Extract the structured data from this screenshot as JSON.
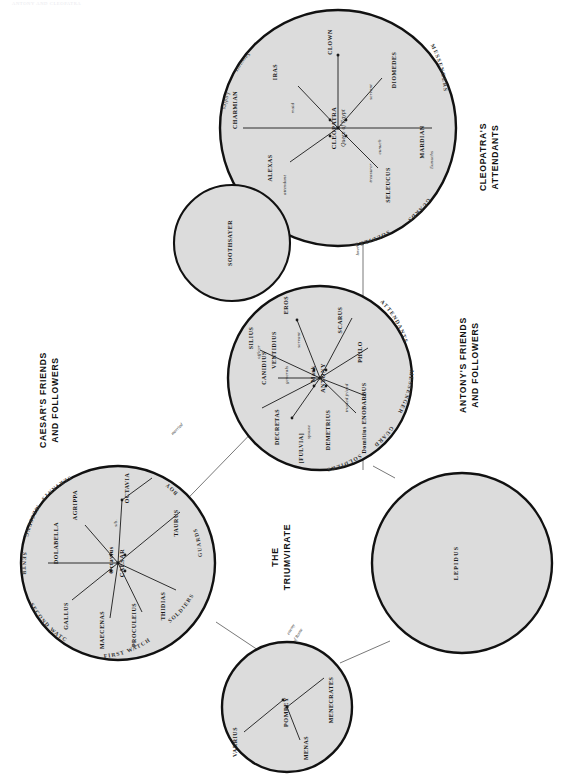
{
  "page": {
    "header_text": "ANTONY AND CLEOPATRA",
    "fill_color": "#dcdcdc",
    "stroke_color": "#111111",
    "background": "#ffffff"
  },
  "group_labels": [
    {
      "id": "cleopatra",
      "lines": [
        "CLEOPATRA'S",
        "ATTENDANTS"
      ]
    },
    {
      "id": "antony",
      "lines": [
        "ANTONY'S FRIENDS",
        "AND FOLLOWERS"
      ]
    },
    {
      "id": "caesar",
      "lines": [
        "CAESAR'S FRIENDS",
        "AND FOLLOWERS"
      ]
    },
    {
      "id": "triumvirate",
      "lines": [
        "THE",
        "TRIUMVIRATE"
      ]
    }
  ],
  "circles": {
    "cleopatra": {
      "center_name": "CLEOPATRA",
      "center_title": "Queen of Egypt",
      "members": [
        {
          "name": "CLOWN",
          "relation": ""
        },
        {
          "name": "IRAS",
          "relation": "maid"
        },
        {
          "name": "CHARMIAN",
          "relation": ""
        },
        {
          "name": "ALEXAS",
          "relation": "attendant"
        },
        {
          "name": "SELEUCUS",
          "relation": "treasurer"
        },
        {
          "name": "MARDIAN",
          "relation": "eunuch"
        },
        {
          "name": "DIOMEDES",
          "relation": "servant"
        }
      ],
      "rim_labels": [
        "MESSENGERS",
        "GUARDS",
        "SOLDIERS"
      ],
      "rim_labels_italic": [
        "Servants",
        "Ladies"
      ],
      "sub_labels": [
        "Eunuchs"
      ]
    },
    "soothsayer": {
      "center_name": "SOOTHSAYER",
      "members": [],
      "rim_labels": []
    },
    "antony": {
      "center_name": "Mark ANTONY",
      "center_name_line1": "Mark",
      "center_name_line2": "ANTONY",
      "members": [
        {
          "name": "EROS",
          "relation": "servant"
        },
        {
          "name": "SILIUS",
          "relation": "officer"
        },
        {
          "name": "CANIDIUS",
          "relation": "generals"
        },
        {
          "name": "VENTIDIUS",
          "relation": "generals"
        },
        {
          "name": "DECRETAS",
          "relation": ""
        },
        {
          "name": "[FULVIA]",
          "relation": "spouse"
        },
        {
          "name": "DEMETRIUS",
          "relation": ""
        },
        {
          "name": "Domitius ENOBARBUS",
          "relation": "trusted friend"
        },
        {
          "name": "PHILO",
          "relation": ""
        },
        {
          "name": "SCARUS",
          "relation": ""
        }
      ],
      "rim_labels": [
        "ATTENDANTS",
        "MESSENGERS",
        "GUARDS",
        "SOLDIERS"
      ]
    },
    "caesar": {
      "center_name": "Octavius CAESAR",
      "center_name_line1": "Octavius",
      "center_name_line2": "CAESAR",
      "members": [
        {
          "name": "OCTAVIA",
          "relation": "sib."
        },
        {
          "name": "AGRIPPA",
          "relation": ""
        },
        {
          "name": "DOLABELLA",
          "relation": ""
        },
        {
          "name": "GALLUS",
          "relation": ""
        },
        {
          "name": "MAECENAS",
          "relation": ""
        },
        {
          "name": "PROCULEIUS",
          "relation": ""
        },
        {
          "name": "THIDIAS",
          "relation": ""
        },
        {
          "name": "TAURUS",
          "relation": ""
        }
      ],
      "rim_labels": [
        "SERVANTS",
        "MESSENGERS",
        "SENTRY",
        "SECOND WATCH",
        "FIRST WATCH",
        "SOLDIERS",
        "GUARDS",
        "BOY"
      ]
    },
    "lepidus": {
      "center_name": "LEPIDUS",
      "members": [],
      "rim_labels": []
    },
    "pompey": {
      "center_name": "POMPEY",
      "members": [
        {
          "name": "MENECRATES",
          "relation": ""
        },
        {
          "name": "MENAS",
          "relation": ""
        },
        {
          "name": "VARRIUS",
          "relation": ""
        }
      ],
      "rim_labels": []
    }
  },
  "connections": [
    {
      "from": "cleopatra",
      "to": "antony",
      "label": "lovers"
    },
    {
      "from": "caesar",
      "to": "antony",
      "label": "married"
    },
    {
      "from": "pompey",
      "to": "caesar",
      "label": "enemy of Rome"
    },
    {
      "from": "antony",
      "to": "lepidus",
      "label": ""
    },
    {
      "from": "pompey",
      "to": "lepidus",
      "label": ""
    }
  ]
}
